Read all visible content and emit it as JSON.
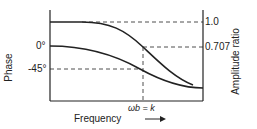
{
  "diagram": {
    "xlabel": "Frequency",
    "left_axis_label": "Phase",
    "right_axis_label": "Amplitude ratio",
    "left_ticks": [
      "0°",
      "-45°"
    ],
    "right_ticks": [
      "1.0",
      "0.707"
    ],
    "marker_label": "ωb = k",
    "curves": [
      "amplitude ratio",
      "phase"
    ]
  }
}
